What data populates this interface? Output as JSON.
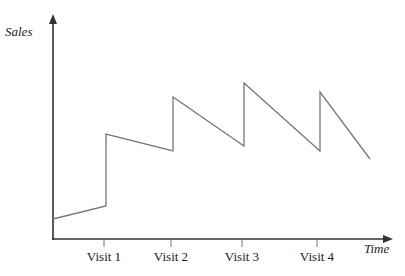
{
  "chart_data": {
    "type": "line",
    "title": "",
    "xlabel": "Time",
    "ylabel": "Sales",
    "x_ticks": [
      "Visit 1",
      "Visit 2",
      "Visit 3",
      "Visit 4"
    ],
    "grid": false,
    "legend": null,
    "axis_units": "qualitative (no numeric scale shown)",
    "series": [
      {
        "name": "Sales",
        "description": "Sawtooth pattern: sales jump up at each visit, then decline until the next visit",
        "points": [
          {
            "x": 0.0,
            "y": 0.12
          },
          {
            "x": 1.0,
            "y": 0.21
          },
          {
            "x": 1.0,
            "y": 0.68
          },
          {
            "x": 2.0,
            "y": 0.57
          },
          {
            "x": 2.0,
            "y": 0.92
          },
          {
            "x": 3.0,
            "y": 0.61
          },
          {
            "x": 3.0,
            "y": 1.01
          },
          {
            "x": 4.0,
            "y": 0.57
          },
          {
            "x": 4.0,
            "y": 0.95
          },
          {
            "x": 4.7,
            "y": 0.52
          }
        ]
      }
    ]
  },
  "axes": {
    "y_label": "Sales",
    "x_label": "Time",
    "ticks": [
      {
        "label": "Visit 1",
        "px": 104
      },
      {
        "label": "Visit 2",
        "px": 171
      },
      {
        "label": "Visit 3",
        "px": 242
      },
      {
        "label": "Visit 4",
        "px": 317
      }
    ]
  },
  "polyline_px": "53,219 106,206 106,134 173,151 173,97 244,146 244,83 320,151 320,92 370,159"
}
